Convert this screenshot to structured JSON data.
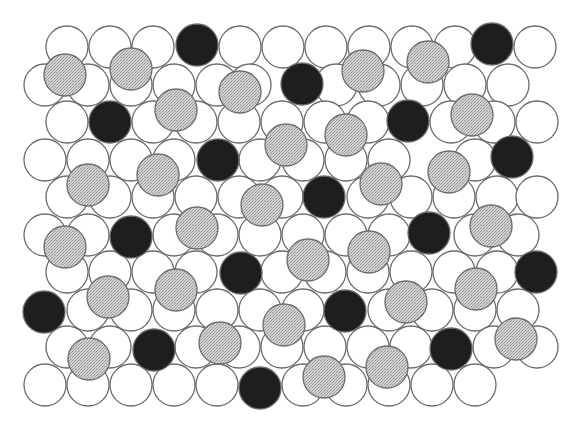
{
  "diagram": {
    "width": 581,
    "height": 431,
    "radius": 21,
    "colors": {
      "white_fill": "#ffffff",
      "gray_fill": "#c9c9c9",
      "black_fill": "#1e1e1e",
      "stroke": "#6a6a6a"
    },
    "legend": {
      "white": "particle (white)",
      "gray": "particle (stippled gray)",
      "black": "particle (black)"
    },
    "white_circles": [
      [
        67,
        47
      ],
      [
        110,
        47
      ],
      [
        153,
        47
      ],
      [
        240,
        47
      ],
      [
        283,
        47
      ],
      [
        326,
        47
      ],
      [
        369,
        47
      ],
      [
        412,
        47
      ],
      [
        455,
        47
      ],
      [
        535,
        47
      ],
      [
        45,
        85
      ],
      [
        88,
        85
      ],
      [
        131,
        85
      ],
      [
        174,
        85
      ],
      [
        217,
        85
      ],
      [
        250,
        85
      ],
      [
        336,
        85
      ],
      [
        379,
        85
      ],
      [
        422,
        85
      ],
      [
        465,
        85
      ],
      [
        508,
        85
      ],
      [
        67,
        122
      ],
      [
        153,
        122
      ],
      [
        196,
        122
      ],
      [
        239,
        122
      ],
      [
        282,
        122
      ],
      [
        325,
        122
      ],
      [
        368,
        122
      ],
      [
        451,
        122
      ],
      [
        494,
        122
      ],
      [
        537,
        122
      ],
      [
        45,
        160
      ],
      [
        88,
        160
      ],
      [
        131,
        160
      ],
      [
        174,
        160
      ],
      [
        260,
        160
      ],
      [
        303,
        160
      ],
      [
        346,
        160
      ],
      [
        389,
        160
      ],
      [
        475,
        160
      ],
      [
        67,
        197
      ],
      [
        110,
        197
      ],
      [
        153,
        197
      ],
      [
        196,
        197
      ],
      [
        239,
        197
      ],
      [
        282,
        197
      ],
      [
        368,
        197
      ],
      [
        411,
        197
      ],
      [
        454,
        197
      ],
      [
        497,
        197
      ],
      [
        537,
        197
      ],
      [
        45,
        235
      ],
      [
        88,
        235
      ],
      [
        174,
        235
      ],
      [
        217,
        235
      ],
      [
        260,
        235
      ],
      [
        303,
        235
      ],
      [
        346,
        235
      ],
      [
        389,
        235
      ],
      [
        475,
        235
      ],
      [
        518,
        235
      ],
      [
        67,
        272
      ],
      [
        110,
        272
      ],
      [
        153,
        272
      ],
      [
        196,
        272
      ],
      [
        282,
        272
      ],
      [
        325,
        272
      ],
      [
        368,
        272
      ],
      [
        411,
        272
      ],
      [
        454,
        272
      ],
      [
        497,
        272
      ],
      [
        88,
        310
      ],
      [
        131,
        310
      ],
      [
        174,
        310
      ],
      [
        217,
        310
      ],
      [
        260,
        310
      ],
      [
        303,
        310
      ],
      [
        389,
        310
      ],
      [
        432,
        310
      ],
      [
        475,
        310
      ],
      [
        518,
        310
      ],
      [
        67,
        347
      ],
      [
        110,
        347
      ],
      [
        196,
        347
      ],
      [
        239,
        347
      ],
      [
        282,
        347
      ],
      [
        325,
        347
      ],
      [
        368,
        347
      ],
      [
        411,
        347
      ],
      [
        494,
        347
      ],
      [
        537,
        347
      ],
      [
        45,
        385
      ],
      [
        88,
        385
      ],
      [
        131,
        385
      ],
      [
        174,
        385
      ],
      [
        217,
        385
      ],
      [
        303,
        385
      ],
      [
        346,
        385
      ],
      [
        389,
        385
      ],
      [
        432,
        385
      ],
      [
        475,
        385
      ]
    ],
    "gray_circles": [
      [
        65,
        75
      ],
      [
        131,
        69
      ],
      [
        240,
        92
      ],
      [
        363,
        71
      ],
      [
        428,
        62
      ],
      [
        176,
        110
      ],
      [
        286,
        145
      ],
      [
        346,
        135
      ],
      [
        472,
        115
      ],
      [
        88,
        185
      ],
      [
        158,
        175
      ],
      [
        262,
        205
      ],
      [
        381,
        184
      ],
      [
        449,
        172
      ],
      [
        65,
        247
      ],
      [
        197,
        228
      ],
      [
        308,
        260
      ],
      [
        369,
        252
      ],
      [
        491,
        226
      ],
      [
        108,
        297
      ],
      [
        176,
        290
      ],
      [
        284,
        325
      ],
      [
        406,
        302
      ],
      [
        476,
        289
      ],
      [
        89,
        359
      ],
      [
        220,
        343
      ],
      [
        324,
        377
      ],
      [
        387,
        367
      ],
      [
        516,
        339
      ]
    ],
    "black_circles": [
      [
        197,
        45
      ],
      [
        492,
        44
      ],
      [
        302,
        84
      ],
      [
        110,
        122
      ],
      [
        408,
        121
      ],
      [
        218,
        160
      ],
      [
        512,
        157
      ],
      [
        324,
        197
      ],
      [
        131,
        237
      ],
      [
        429,
        233
      ],
      [
        241,
        273
      ],
      [
        536,
        272
      ],
      [
        44,
        312
      ],
      [
        345,
        311
      ],
      [
        154,
        350
      ],
      [
        451,
        349
      ],
      [
        260,
        388
      ]
    ]
  }
}
